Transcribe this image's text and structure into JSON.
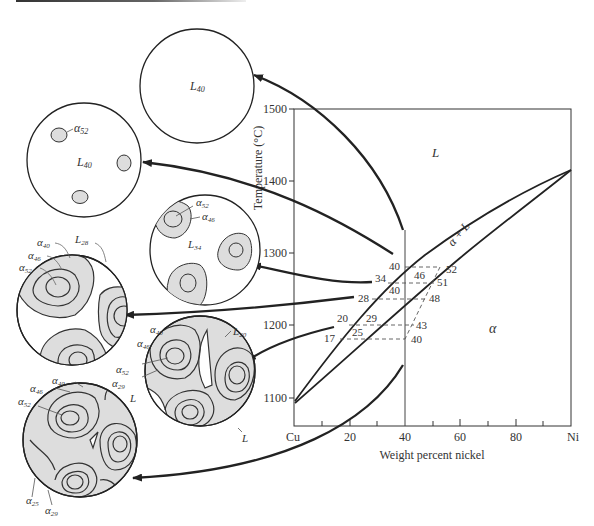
{
  "figure": {
    "type": "binary-phase-diagram-with-microstructures",
    "system": "Cu-Ni"
  },
  "axes": {
    "ylabel": "Temperature (°C)",
    "xlabel": "Weight percent nickel",
    "yticks": [
      "1500",
      "1400",
      "1300",
      "1200",
      "1100"
    ],
    "xticks": [
      "Cu",
      "20",
      "40",
      "60",
      "80",
      "Ni"
    ]
  },
  "regions": {
    "liquid": "L",
    "two_phase": "α + L",
    "solid": "α"
  },
  "tie_lines": [
    {
      "liquid_comp": "40",
      "solid_comp": "52"
    },
    {
      "liquid_comp": "34",
      "mid_label": "46",
      "solid_comp": "51"
    },
    {
      "liquid_comp": "28",
      "mid_label": "40",
      "solid_comp": "48"
    },
    {
      "liquid_comp": "20",
      "mid_label": "29",
      "solid_comp": "43"
    },
    {
      "liquid_comp": "17",
      "mid_label": "25",
      "solid_comp": "40"
    }
  ],
  "microstructures": [
    {
      "id": "c1",
      "labels": [
        "L40"
      ]
    },
    {
      "id": "c2",
      "labels": [
        "α52",
        "L40"
      ]
    },
    {
      "id": "c3",
      "labels": [
        "α52",
        "α46",
        "L34"
      ]
    },
    {
      "id": "c4",
      "labels": [
        "α40",
        "α46",
        "α52",
        "L28"
      ]
    },
    {
      "id": "c5",
      "labels": [
        "α40",
        "α46",
        "α52",
        "α29",
        "L20",
        "L"
      ]
    },
    {
      "id": "c6",
      "labels": [
        "α40",
        "α46",
        "α52",
        "α25",
        "α29",
        "L"
      ]
    }
  ],
  "labels": {
    "L40": {
      "base": "L",
      "sub": "40"
    },
    "L34": {
      "base": "L",
      "sub": "34"
    },
    "L28": {
      "base": "L",
      "sub": "28"
    },
    "L20": {
      "base": "L",
      "sub": "20"
    },
    "a52": {
      "base": "α",
      "sub": "52"
    },
    "a46": {
      "base": "α",
      "sub": "46"
    },
    "a40": {
      "base": "α",
      "sub": "40"
    },
    "a29": {
      "base": "α",
      "sub": "29"
    },
    "a25": {
      "base": "α",
      "sub": "25"
    },
    "L": "L"
  },
  "colors": {
    "line": "#222222",
    "grain_fill": "#d9d9d9",
    "dash": "#555555"
  }
}
